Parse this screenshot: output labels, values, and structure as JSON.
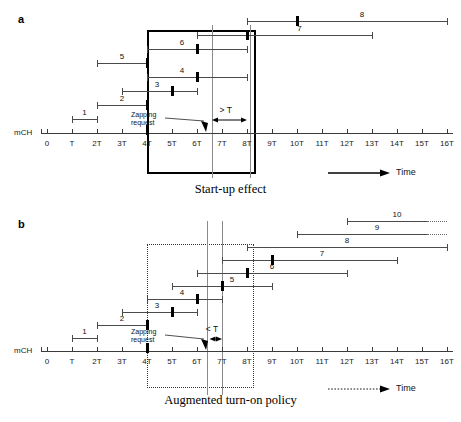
{
  "figure": {
    "axis": {
      "origin_x": 47,
      "unit_px": 25,
      "mch_label": "mCH",
      "tick_labels": [
        "0",
        "T",
        "2T",
        "3T",
        "4T",
        "5T",
        "6T",
        "7T",
        "8T",
        "9T",
        "10T",
        "11T",
        "12T",
        "13T",
        "14T",
        "15T",
        "16T"
      ],
      "tick_values": [
        0,
        1,
        2,
        3,
        4,
        5,
        6,
        7,
        8,
        9,
        10,
        11,
        12,
        13,
        14,
        15,
        16
      ],
      "axis_min": 0,
      "axis_max": 16
    },
    "panels": [
      {
        "id": "a",
        "letter": "a",
        "caption": "Start-up effect",
        "time_legend": "Time",
        "time_arrow_style": "solid",
        "zapping_label_line1": "Zapping",
        "zapping_label_line2": "request",
        "gap_label": "> T",
        "gap_start": 6.6,
        "gap_end": 8.0,
        "zap_time": 6.4,
        "box": {
          "x0": 4.0,
          "x1": 8.2,
          "style": "solid"
        },
        "guide_lines": [
          6.6,
          8.1
        ],
        "rows": [
          {
            "num": "1",
            "start": 1,
            "end": 2,
            "mark": null,
            "dotted_tail": false,
            "label_x": 1.5
          },
          {
            "num": "2",
            "start": 2,
            "end": 4,
            "mark": 4,
            "dotted_tail": false,
            "label_x": 3.0
          },
          {
            "num": "3",
            "start": 3,
            "end": 6,
            "mark": 5,
            "dotted_tail": false,
            "label_x": 4.4
          },
          {
            "num": "4",
            "start": 4,
            "end": 8,
            "mark": 6,
            "dotted_tail": false,
            "label_x": 5.4
          },
          {
            "num": "5",
            "start": 2,
            "end": 4,
            "mark": 4,
            "dotted_tail": false,
            "label_x": 3.0
          },
          {
            "num": "6",
            "start": 4,
            "end": 8,
            "mark": 6,
            "dotted_tail": false,
            "label_x": 5.4
          },
          {
            "num": "7",
            "start": 6,
            "end": 13,
            "mark": 8,
            "dotted_tail": false,
            "label_x": 10.1
          },
          {
            "num": "8",
            "start": 8,
            "end": 16,
            "mark": 10,
            "dotted_tail": false,
            "label_x": 12.6
          }
        ]
      },
      {
        "id": "b",
        "letter": "b",
        "caption": "Augmented turn-on policy",
        "time_legend": "Time",
        "time_arrow_style": "dotted",
        "zapping_label_line1": "Zapping",
        "zapping_label_line2": "request",
        "gap_label": "< T",
        "gap_start": 6.5,
        "gap_end": 7.0,
        "zap_time": 6.4,
        "box": {
          "x0": 4.0,
          "x1": 8.2,
          "style": "dotted"
        },
        "guide_lines": [
          6.4,
          7.0
        ],
        "rows": [
          {
            "num": "1",
            "start": 1,
            "end": 2,
            "mark": null,
            "dotted_tail": false,
            "label_x": 1.5
          },
          {
            "num": "2",
            "start": 2,
            "end": 4,
            "mark": 4,
            "dotted_tail": false,
            "label_x": 3.0
          },
          {
            "num": "3",
            "start": 3,
            "end": 6,
            "mark": 5,
            "dotted_tail": false,
            "label_x": 4.4
          },
          {
            "num": "4",
            "start": 4,
            "end": 7,
            "mark": 6,
            "dotted_tail": false,
            "label_x": 5.4
          },
          {
            "num": "5",
            "start": 5,
            "end": 9,
            "mark": 7,
            "dotted_tail": false,
            "label_x": 7.4
          },
          {
            "num": "6",
            "start": 6,
            "end": 12,
            "mark": 8,
            "dotted_tail": false,
            "label_x": 9.0
          },
          {
            "num": "7",
            "start": 7,
            "end": 14,
            "mark": 9,
            "dotted_tail": false,
            "label_x": 11.0
          },
          {
            "num": "8",
            "start": 8,
            "end": 16,
            "mark": null,
            "dotted_tail": false,
            "label_x": 12.0
          },
          {
            "num": "9",
            "start": 10,
            "end": 15.2,
            "mark": null,
            "dotted_tail": true,
            "label_x": 13.2
          },
          {
            "num": "10",
            "start": 12,
            "end": 15.2,
            "mark": null,
            "dotted_tail": true,
            "label_x": 14.0
          }
        ]
      }
    ]
  }
}
